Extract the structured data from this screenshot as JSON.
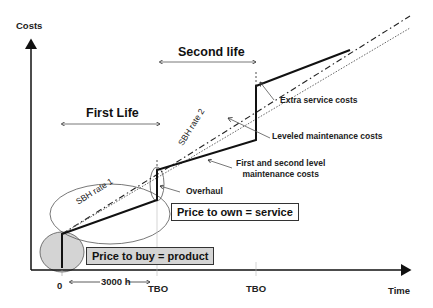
{
  "diagram": {
    "y_axis_label": "Costs",
    "x_axis_label": "Time",
    "x_ticks": [
      "0",
      "TBO",
      "TBO"
    ],
    "interval_label": "3000 h",
    "phases": [
      {
        "label": "First Life"
      },
      {
        "label": "Second life"
      }
    ],
    "line_labels": {
      "sbh_rate_1": "SBH rate 1",
      "sbh_rate_2": "SBH rate 2"
    },
    "annotations": [
      {
        "label": "Extra service costs"
      },
      {
        "label": "Leveled maintenance costs"
      },
      {
        "label": "First and second level maintenance costs",
        "line1": "First and second level",
        "line2": "maintenance costs"
      },
      {
        "label": "Overhaul"
      }
    ],
    "boxes": {
      "own": "Price to own = service",
      "buy": "Price to buy = product"
    },
    "colors": {
      "line": "#111111",
      "buy_fill": "#d4d4d4",
      "background": "#ffffff"
    }
  }
}
